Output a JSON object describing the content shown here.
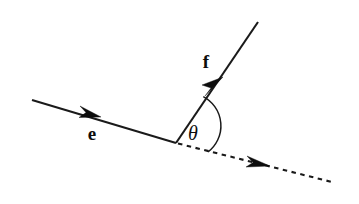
{
  "figure": {
    "background_color": "#ffffff",
    "stroke_color": "#1a1a1a",
    "width": 359,
    "height": 204
  },
  "labels": {
    "incoming_vector": "e",
    "outgoing_vector": "f",
    "angle": "θ"
  },
  "geometry": {
    "vertex": {
      "x": 176,
      "y": 143
    },
    "e_ray": {
      "x1": 32,
      "y1": 100,
      "x2": 176,
      "y2": 143
    },
    "f_ray": {
      "x1": 176,
      "y1": 143,
      "x2": 258,
      "y2": 22
    },
    "dashed_ray": {
      "x1": 176,
      "y1": 143,
      "x2": 332,
      "y2": 182
    },
    "e_arrow_tip": {
      "x": 101,
      "y": 116
    },
    "f_arrow_tip": {
      "x": 223,
      "y": 77
    },
    "dashed_arrow_tip": {
      "x": 270,
      "y": 166
    },
    "arc": {
      "start_x": 203,
      "start_y": 97,
      "end_x": 219,
      "end_y": 155,
      "radius": 33
    }
  },
  "label_positions": {
    "e": {
      "x": 92,
      "y": 140
    },
    "f": {
      "x": 206,
      "y": 68
    },
    "theta": {
      "x": 193,
      "y": 140
    }
  },
  "icon_names": {
    "e_arrowhead": "arrowhead-icon",
    "f_arrowhead": "arrowhead-icon",
    "dashed_arrowhead": "arrowhead-icon"
  }
}
